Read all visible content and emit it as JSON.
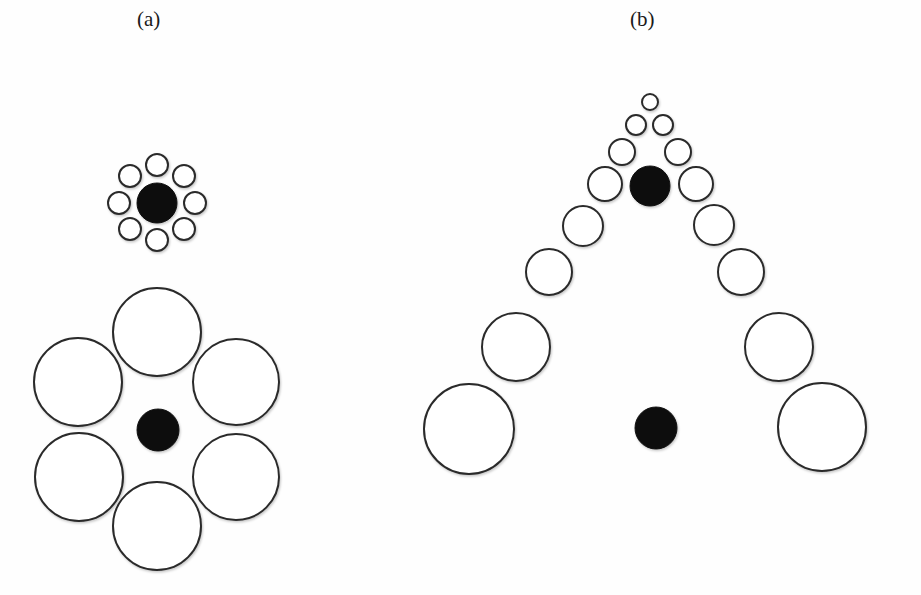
{
  "figure": {
    "panels": [
      {
        "id": "a",
        "label": "(a)"
      },
      {
        "id": "b",
        "label": "(b)"
      }
    ]
  },
  "colors": {
    "background": "#fefefe",
    "stroke": "#2b2b2b",
    "fill_black": "#111111",
    "fill_white": "#ffffff",
    "label": "#1a1a1a"
  },
  "circles": {
    "panel_a_small_cluster": {
      "center": {
        "cx": 157,
        "cy": 203,
        "r": 20,
        "fill": "black"
      },
      "surround": [
        {
          "cx": 157,
          "cy": 165,
          "r": 11
        },
        {
          "cx": 184,
          "cy": 176,
          "r": 11
        },
        {
          "cx": 195,
          "cy": 203,
          "r": 11
        },
        {
          "cx": 184,
          "cy": 229,
          "r": 11
        },
        {
          "cx": 157,
          "cy": 240,
          "r": 11
        },
        {
          "cx": 130,
          "cy": 229,
          "r": 11
        },
        {
          "cx": 119,
          "cy": 203,
          "r": 11
        },
        {
          "cx": 130,
          "cy": 176,
          "r": 11
        }
      ]
    },
    "panel_a_large_cluster": {
      "center": {
        "cx": 158,
        "cy": 430,
        "r": 21,
        "fill": "black"
      },
      "surround": [
        {
          "cx": 157,
          "cy": 332,
          "r": 44
        },
        {
          "cx": 236,
          "cy": 382,
          "r": 43
        },
        {
          "cx": 236,
          "cy": 477,
          "r": 43
        },
        {
          "cx": 157,
          "cy": 526,
          "r": 44
        },
        {
          "cx": 79,
          "cy": 477,
          "r": 44
        },
        {
          "cx": 78,
          "cy": 382,
          "r": 44
        }
      ]
    },
    "panel_b": {
      "black": [
        {
          "cx": 650,
          "cy": 186,
          "r": 20
        },
        {
          "cx": 656,
          "cy": 428,
          "r": 21
        }
      ],
      "white": [
        {
          "cx": 650,
          "cy": 102,
          "r": 8
        },
        {
          "cx": 636,
          "cy": 125,
          "r": 10
        },
        {
          "cx": 663,
          "cy": 125,
          "r": 10
        },
        {
          "cx": 622,
          "cy": 152,
          "r": 13
        },
        {
          "cx": 678,
          "cy": 152,
          "r": 13
        },
        {
          "cx": 605,
          "cy": 184,
          "r": 17
        },
        {
          "cx": 696,
          "cy": 184,
          "r": 17
        },
        {
          "cx": 583,
          "cy": 226,
          "r": 20
        },
        {
          "cx": 714,
          "cy": 225,
          "r": 20
        },
        {
          "cx": 549,
          "cy": 272,
          "r": 23
        },
        {
          "cx": 741,
          "cy": 272,
          "r": 23
        },
        {
          "cx": 516,
          "cy": 347,
          "r": 34
        },
        {
          "cx": 779,
          "cy": 347,
          "r": 34
        },
        {
          "cx": 469,
          "cy": 429,
          "r": 45
        },
        {
          "cx": 822,
          "cy": 427,
          "r": 44
        }
      ]
    }
  }
}
